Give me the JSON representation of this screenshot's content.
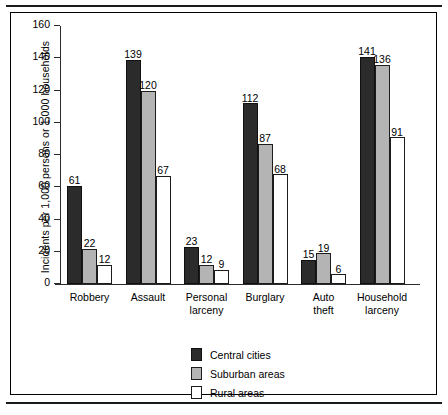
{
  "chart_data": {
    "type": "bar",
    "title": "",
    "xlabel": "",
    "ylabel": "Incidents per 1,000 persons or 1,000 households",
    "ylim": [
      0,
      160
    ],
    "yticks": [
      0,
      20,
      40,
      60,
      80,
      100,
      120,
      140,
      160
    ],
    "grid": false,
    "legend_position": "bottom-center",
    "categories": [
      "Robbery",
      "Assault",
      "Personal larceny",
      "Burglary",
      "Auto theft",
      "Household larceny"
    ],
    "category_lines": [
      [
        "Robbery"
      ],
      [
        "Assault"
      ],
      [
        "Personal",
        "larceny"
      ],
      [
        "Burglary"
      ],
      [
        "Auto",
        "theft"
      ],
      [
        "Household",
        "larceny"
      ]
    ],
    "series": [
      {
        "name": "Central cities",
        "color": "#2b2b2b",
        "values": [
          61,
          139,
          23,
          112,
          15,
          141
        ]
      },
      {
        "name": "Suburban areas",
        "color": "#b4b4b4",
        "values": [
          22,
          120,
          12,
          87,
          19,
          136
        ]
      },
      {
        "name": "Rural areas",
        "color": "#ffffff",
        "values": [
          12,
          67,
          9,
          68,
          6,
          91
        ]
      }
    ]
  },
  "legend": {
    "items": [
      {
        "label": "Central cities"
      },
      {
        "label": "Suburban areas"
      },
      {
        "label": "Rural areas"
      }
    ]
  }
}
